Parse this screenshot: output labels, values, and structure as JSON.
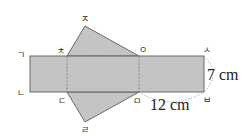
{
  "diagram": {
    "type": "net-of-triangular-prism",
    "colors": {
      "fill": "#c4c4c4",
      "stroke": "#6a6a6a",
      "dashed": "#7a7a7a",
      "arc": "#999999",
      "text": "#222222"
    },
    "vertices": {
      "g": {
        "label": "ㄱ",
        "x": 20,
        "y": 56
      },
      "n": {
        "label": "ㄴ",
        "x": 20,
        "y": 93
      },
      "d": {
        "label": "ㄷ",
        "x": 61,
        "y": 104
      },
      "r": {
        "label": "ㄹ",
        "x": 85,
        "y": 132
      },
      "m": {
        "label": "ㅁ",
        "x": 136,
        "y": 103
      },
      "b": {
        "label": "ㅂ",
        "x": 206,
        "y": 102
      },
      "s": {
        "label": "ㅅ",
        "x": 206,
        "y": 51
      },
      "o": {
        "label": "ㅇ",
        "x": 142,
        "y": 51
      },
      "j": {
        "label": "ㅈ",
        "x": 84,
        "y": 20
      },
      "ch": {
        "label": "ㅊ",
        "x": 60,
        "y": 51
      }
    },
    "measurements": {
      "height": "7 cm",
      "width": "12 cm"
    }
  }
}
